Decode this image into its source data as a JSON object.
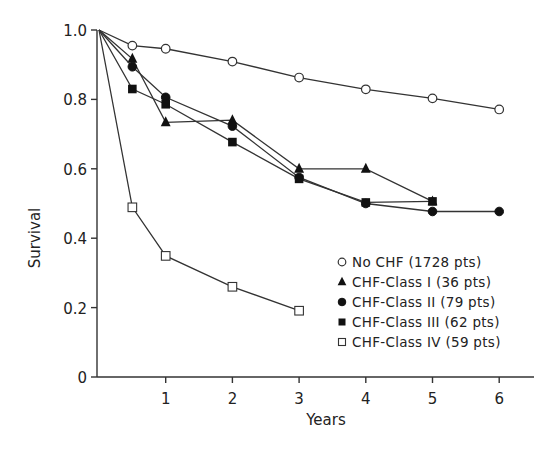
{
  "chart_data": {
    "type": "line",
    "title": "",
    "xlabel": "Years",
    "ylabel": "Survival",
    "xlim": [
      0,
      6.5
    ],
    "ylim": [
      0,
      1.0
    ],
    "grid": false,
    "legend_position": "lower right (inside)",
    "x_ticks": [
      1,
      2,
      3,
      4,
      5,
      6
    ],
    "x_tick_labels": [
      "1",
      "2",
      "3",
      "4",
      "5",
      "6"
    ],
    "y_ticks": [
      0,
      0.2,
      0.4,
      0.6,
      0.8,
      1.0
    ],
    "y_tick_labels": [
      "0",
      "0.2",
      "0.4",
      "0.6",
      "0.8",
      "1.0"
    ],
    "series": [
      {
        "name": "No CHF (1728 pts)",
        "marker": "open-circle",
        "x": [
          0,
          0.5,
          1,
          2,
          3,
          4,
          5,
          6
        ],
        "values": [
          1.0,
          0.955,
          0.946,
          0.909,
          0.863,
          0.829,
          0.803,
          0.771
        ]
      },
      {
        "name": "CHF-Class I (36 pts)",
        "marker": "filled-triangle",
        "x": [
          0,
          0.5,
          1,
          2,
          3,
          4,
          5
        ],
        "values": [
          1.0,
          0.917,
          0.734,
          0.74,
          0.6,
          0.6,
          0.506
        ]
      },
      {
        "name": "CHF-Class II (79 pts)",
        "marker": "filled-circle",
        "x": [
          0,
          0.5,
          1,
          2,
          3,
          4,
          5,
          6
        ],
        "values": [
          1.0,
          0.894,
          0.806,
          0.723,
          0.575,
          0.5,
          0.477,
          0.477
        ]
      },
      {
        "name": "CHF-Class III (62 pts)",
        "marker": "filled-square",
        "x": [
          0,
          0.5,
          1,
          2,
          3,
          4,
          5
        ],
        "values": [
          1.0,
          0.83,
          0.786,
          0.677,
          0.571,
          0.503,
          0.506
        ]
      },
      {
        "name": "CHF-Class IV (59 pts)",
        "marker": "open-square",
        "x": [
          0,
          0.5,
          1,
          2,
          3
        ],
        "values": [
          1.0,
          0.489,
          0.349,
          0.26,
          0.191
        ]
      }
    ]
  }
}
